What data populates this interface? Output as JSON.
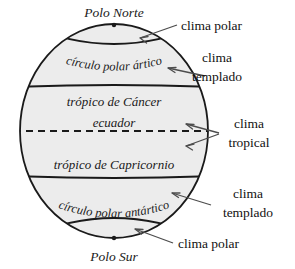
{
  "diagram": {
    "title_poles": {
      "north": "Polo Norte",
      "south": "Polo Sur"
    },
    "globe": {
      "fill_color": "#ececec",
      "stroke_color": "#1a1a1a",
      "center_x": 114,
      "center_y": 131,
      "radius_x": 94,
      "radius_y": 107
    },
    "latitude_lines": [
      {
        "name": "circulo-polar-artico",
        "label": "círculo polar ártico",
        "style": "solid",
        "y": 45
      },
      {
        "name": "tropico-de-cancer",
        "label": "trópico de Cáncer",
        "style": "solid",
        "y": 87
      },
      {
        "name": "ecuador",
        "label": "ecuador",
        "style": "dashed",
        "y": 131
      },
      {
        "name": "tropico-de-capricornio",
        "label": "trópico de Capricornio",
        "style": "solid",
        "y": 176
      },
      {
        "name": "circulo-polar-antartico",
        "label": "círculo polar antártico",
        "style": "solid",
        "y": 222
      }
    ],
    "climate_labels": [
      {
        "id": "clima-polar-norte",
        "line1": "clima polar",
        "line2": ""
      },
      {
        "id": "clima-templado-norte",
        "line1": "clima",
        "line2": "templado"
      },
      {
        "id": "clima-tropical",
        "line1": "clima",
        "line2": "tropical"
      },
      {
        "id": "clima-templado-sur",
        "line1": "clima",
        "line2": "templado"
      },
      {
        "id": "clima-polar-sur",
        "line1": "clima polar",
        "line2": ""
      }
    ],
    "colors": {
      "ink": "#1a1a1a",
      "band_fill": "#ececec",
      "background": "#ffffff",
      "arrow": "#4d4d4d"
    }
  }
}
